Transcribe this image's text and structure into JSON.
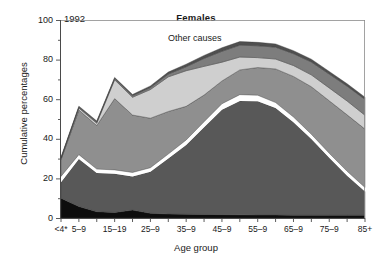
{
  "chart": {
    "year_label": "1992",
    "title": "Females",
    "annotation": "Other causes",
    "x_axis_title": "Age group",
    "y_axis_title": "Cumulative percentages"
  },
  "chart_data": {
    "type": "area",
    "title": "Females",
    "subtitle": "1992",
    "xlabel": "Age group",
    "ylabel": "Cumulative percentages",
    "ylim": [
      0,
      100
    ],
    "yticks": [
      0,
      20,
      40,
      60,
      80,
      100
    ],
    "yticks_minor": [
      10,
      30,
      50,
      70,
      90
    ],
    "grid": false,
    "legend": "none",
    "annotations": [
      {
        "text": "Other causes",
        "x": "35-9",
        "y": 93
      }
    ],
    "categories": [
      "<4*",
      "5–9",
      "10–14",
      "15–19",
      "20–4",
      "25–9",
      "30–4",
      "35–9",
      "40–4",
      "45–9",
      "50–4",
      "55–9",
      "60–4",
      "65–9",
      "70–4",
      "75–9",
      "80–4",
      "85+"
    ],
    "tick_labels": [
      "<4*",
      "5–9",
      "",
      "15–19",
      "",
      "25–9",
      "",
      "35–9",
      "",
      "45–9",
      "",
      "55–9",
      "",
      "65–9",
      "",
      "75–9",
      "",
      "85+"
    ],
    "stack_order": "bottom-to-top",
    "series": [
      {
        "name": "band-1-black",
        "color": "#0d0d0d",
        "values": [
          10.0,
          5.8,
          3.2,
          2.8,
          4.0,
          2.4,
          2.0,
          1.9,
          1.8,
          1.7,
          1.6,
          1.5,
          1.5,
          1.4,
          1.4,
          1.4,
          1.4,
          1.4
        ]
      },
      {
        "name": "band-2-dark-grey",
        "color": "#585858",
        "values": [
          8.0,
          24.0,
          19.5,
          19.5,
          17.0,
          21.0,
          28.0,
          35.0,
          44.0,
          53.0,
          57.5,
          57.5,
          54.0,
          47.0,
          38.5,
          29.0,
          20.0,
          12.0
        ]
      },
      {
        "name": "band-3-white",
        "color": "#ffffff",
        "values": [
          3.0,
          2.2,
          2.0,
          2.0,
          2.0,
          2.0,
          2.3,
          2.5,
          2.8,
          3.0,
          3.2,
          3.0,
          2.8,
          2.6,
          2.4,
          2.3,
          2.2,
          2.0
        ]
      },
      {
        "name": "band-4-mid-grey",
        "color": "#8f8f8f",
        "values": [
          8.5,
          22.5,
          22.0,
          36.0,
          29.0,
          25.0,
          21.5,
          17.0,
          13.5,
          11.5,
          12.5,
          14.0,
          17.0,
          20.5,
          24.0,
          26.5,
          28.5,
          29.5
        ]
      },
      {
        "name": "band-5-light-grey",
        "color": "#cfcfcf",
        "values": [
          0.5,
          1.0,
          1.2,
          9.5,
          9.0,
          14.5,
          17.5,
          18.0,
          14.5,
          9.5,
          6.5,
          5.0,
          5.0,
          5.5,
          6.0,
          6.5,
          7.0,
          7.0
        ]
      },
      {
        "name": "band-6-grey-top",
        "color": "#7d7d7d",
        "values": [
          0.3,
          0.5,
          0.6,
          0.7,
          0.8,
          1.0,
          1.4,
          2.0,
          4.0,
          5.5,
          6.0,
          6.0,
          6.0,
          6.0,
          6.5,
          7.0,
          7.5,
          8.0
        ]
      },
      {
        "name": "band-7-dark-cap",
        "color": "#4f4f4f",
        "values": [
          0.4,
          0.5,
          0.5,
          0.5,
          0.6,
          0.8,
          1.0,
          1.3,
          1.5,
          1.8,
          1.8,
          1.7,
          1.6,
          1.5,
          1.4,
          1.3,
          1.2,
          1.1
        ]
      }
    ],
    "cumulative_top": [
      30.7,
      56.5,
      49.0,
      71.0,
      62.4,
      66.7,
      73.7,
      77.7,
      82.1,
      86.0,
      89.1,
      88.7,
      87.9,
      84.5,
      80.2,
      74.0,
      67.8,
      61.0
    ]
  }
}
